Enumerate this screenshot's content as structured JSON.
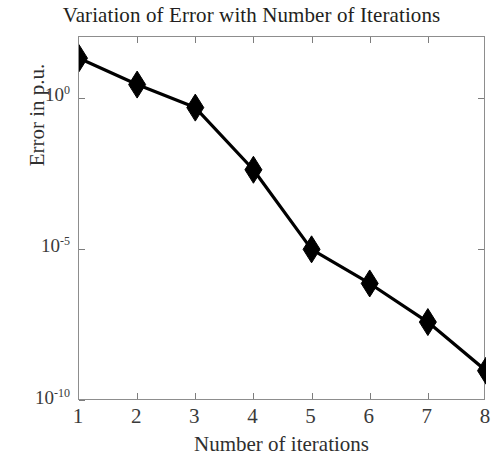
{
  "chart_data": {
    "type": "line",
    "title": "Variation of Error with Number of Iterations",
    "xlabel": "Number of iterations",
    "ylabel": "Error in p.u.",
    "yscale": "log",
    "xlim": [
      1,
      8
    ],
    "ylim": [
      1e-10,
      100
    ],
    "grid": false,
    "legend": null,
    "marker": "diamond",
    "marker_color": "#000000",
    "line_color": "#000000",
    "x": [
      1,
      2,
      3,
      4,
      5,
      6,
      7,
      8
    ],
    "values": [
      20.0,
      2.7,
      0.47,
      0.0042,
      1e-05,
      7.5e-07,
      4e-08,
      1e-09
    ],
    "series": [
      {
        "name": "Error",
        "x": [
          1,
          2,
          3,
          4,
          5,
          6,
          7,
          8
        ],
        "values": [
          20.0,
          2.7,
          0.47,
          0.0042,
          1e-05,
          7.5e-07,
          4e-08,
          1e-09
        ]
      }
    ],
    "xticks": [
      1,
      2,
      3,
      4,
      5,
      6,
      7,
      8
    ],
    "xtick_labels": [
      "1",
      "2",
      "3",
      "4",
      "5",
      "6",
      "7",
      "8"
    ],
    "yticks": [
      1,
      1e-05,
      1e-10
    ],
    "ytick_labels": [
      {
        "base": "10",
        "exponent": "0"
      },
      {
        "base": "10",
        "exponent": "-5"
      },
      {
        "base": "10",
        "exponent": "-10"
      }
    ]
  }
}
